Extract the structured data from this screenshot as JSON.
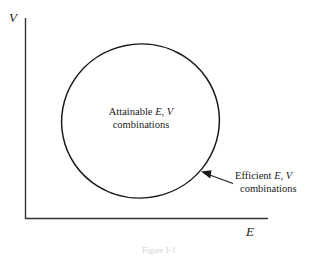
{
  "figure": {
    "caption": "Figure 1-1",
    "axes": {
      "y_label": "V",
      "x_label": "E",
      "line_color": "#333333"
    },
    "region": {
      "name": "attainable-set",
      "outline_color": "#1a1a1a",
      "fill_color": "#ffffff"
    },
    "annotations": {
      "attainable": {
        "line1_prefix": "Attainable ",
        "line1_symbol_e": "E",
        "line1_comma": ", ",
        "line1_symbol_v": "V",
        "line2": "combinations"
      },
      "efficient": {
        "line1_prefix": "Efficient ",
        "line1_symbol_e": "E",
        "line1_comma": ", ",
        "line1_symbol_v": "V",
        "line2": "combinations"
      }
    }
  }
}
